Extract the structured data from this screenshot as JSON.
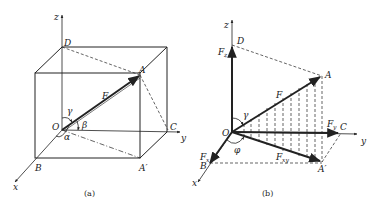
{
  "figure_a": {
    "caption": "(a)",
    "axes": {
      "x": "x",
      "y": "y",
      "z": "z"
    },
    "points": {
      "O": "O",
      "A": "A",
      "A_prime": "A′",
      "B": "B",
      "C": "C",
      "D": "D"
    },
    "force": "F",
    "angles": {
      "alpha": "α",
      "beta": "β",
      "gamma": "γ"
    }
  },
  "figure_b": {
    "caption": "(b)",
    "axes": {
      "x": "x",
      "y": "y",
      "z": "z"
    },
    "points": {
      "O": "O",
      "A": "A",
      "A_prime": "A′",
      "B": "B",
      "C": "C",
      "D": "D"
    },
    "force": "F",
    "components": {
      "Fx": "F",
      "Fx_sub": "x",
      "Fy": "F",
      "Fy_sub": "y",
      "Fz": "F",
      "Fz_sub": "z",
      "Fxy": "F",
      "Fxy_sub": "xy"
    },
    "angles": {
      "gamma": "γ",
      "phi": "φ"
    }
  },
  "colors": {
    "stroke": "#222222",
    "background": "#ffffff"
  }
}
